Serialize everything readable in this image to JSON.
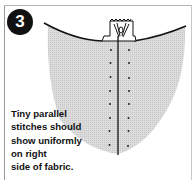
{
  "step": {
    "number": "3"
  },
  "caption": {
    "lines": [
      "Tiny parallel",
      "stitches should",
      "show uniformly",
      "on right",
      "side of fabric."
    ]
  },
  "illustration": {
    "subject": "fabric-seam-with-parallel-stitches",
    "fabric_color": "#d4d4d4",
    "stitch_rows": 8,
    "stitch_columns": 2
  }
}
